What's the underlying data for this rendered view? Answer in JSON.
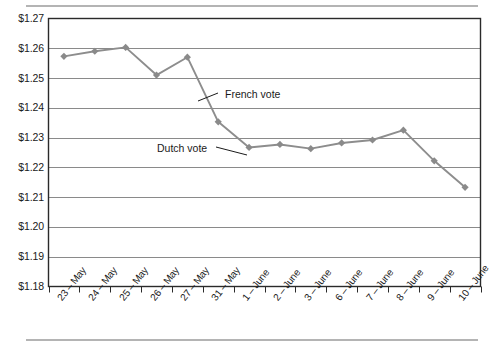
{
  "chart_data": {
    "type": "line",
    "title": "",
    "subtitle": "",
    "xlabel": "",
    "ylabel": "",
    "categories": [
      "23 – May",
      "24 – May",
      "25 – May",
      "26 – May",
      "27 – May",
      "31 – May",
      "1 – June",
      "2 – June",
      "3 – June",
      "6 – June",
      "7 – June",
      "8 – June",
      "9 – June",
      "10 – June"
    ],
    "values": [
      1.2573,
      1.259,
      1.2603,
      1.251,
      1.257,
      1.2353,
      1.2267,
      1.2277,
      1.2263,
      1.2282,
      1.2292,
      1.2325,
      1.2222,
      1.2133
    ],
    "ylim": [
      1.18,
      1.27
    ],
    "ytick_values": [
      1.27,
      1.26,
      1.25,
      1.24,
      1.23,
      1.22,
      1.21,
      1.2,
      1.19,
      1.18
    ],
    "ytick_labels": [
      "$1.27",
      "$1.26",
      "$1.25",
      "$1.24",
      "$1.23",
      "$1.22",
      "$1.21",
      "$1.20",
      "$1.19",
      "$1.18"
    ],
    "grid": true,
    "legend": "none",
    "series_name": "",
    "marker": "diamond",
    "annotations": [
      {
        "text": "French vote",
        "text_x": 225,
        "text_y": 88,
        "leader_from_x": 218,
        "leader_from_y": 93,
        "leader_to_x": 198,
        "leader_to_y": 101
      },
      {
        "text": "Dutch vote",
        "text_x": 157,
        "text_y": 142,
        "leader_from_x": 216,
        "leader_from_y": 147,
        "leader_to_x": 247,
        "leader_to_y": 155
      }
    ],
    "colors": {
      "line": "#8d8d8d",
      "marker": "#8a8a8a",
      "grid": "#8a8a8a",
      "axis": "#2a2a2a",
      "rule": "#b4b4b4",
      "text": "#1a1a1a",
      "background": "#ffffff"
    }
  }
}
